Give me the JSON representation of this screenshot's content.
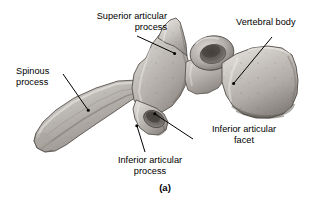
{
  "figure": {
    "caption": "(a)",
    "background_color": "#ffffff",
    "text_color": "#000000",
    "bone_color": "#b2aea9"
  },
  "labels": {
    "superior_articular_process": {
      "line1": "Superior articular",
      "line2": "process"
    },
    "vertebral_body": {
      "line1": "Vertebral body"
    },
    "spinous_process": {
      "line1": "Spinous",
      "line2": "process"
    },
    "inferior_articular_facet": {
      "line1": "Inferior articular",
      "line2": "facet"
    },
    "inferior_articular_process": {
      "line1": "Inferior articular",
      "line2": "process"
    }
  }
}
